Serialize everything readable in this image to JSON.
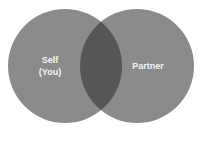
{
  "diagram": {
    "type": "venn",
    "sets": [
      {
        "id": "self",
        "label_lines": [
          "Self",
          "(You)"
        ],
        "color": "#8b8b8b"
      },
      {
        "id": "partner",
        "label_lines": [
          "Partner"
        ],
        "color": "#8b8b8b"
      }
    ],
    "overlap": {
      "color": "#565656"
    },
    "background": "#ffffff"
  }
}
